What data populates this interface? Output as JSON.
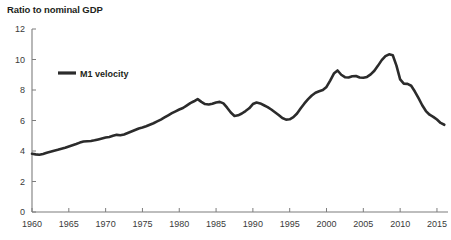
{
  "chart_data": {
    "type": "line",
    "title": "Ratio to nominal GDP",
    "xlabel": "",
    "ylabel": "Ratio to nominal GDP",
    "xlim": [
      1960,
      2016.5
    ],
    "ylim": [
      0,
      12
    ],
    "yticks": [
      0,
      2,
      4,
      6,
      8,
      10,
      12
    ],
    "ytick_labels": [
      "0",
      "2",
      "4",
      "6",
      "8",
      "10",
      "12"
    ],
    "xticks": [
      1960,
      1965,
      1970,
      1975,
      1980,
      1985,
      1990,
      1995,
      2000,
      2005,
      2010,
      2015
    ],
    "xtick_labels": [
      "1960",
      "1965",
      "1970",
      "1975",
      "1980",
      "1985",
      "1990",
      "1995",
      "2000",
      "2005",
      "2010",
      "2015"
    ],
    "grid": false,
    "legend_position": "upper-left-inside",
    "line_color": "#2b2b2b",
    "axis_color": "#7d7d7d",
    "background_color": "#ffffff",
    "series": [
      {
        "name": "M1 velocity",
        "x": [
          1960.0,
          1960.5,
          1961.0,
          1961.5,
          1962.0,
          1962.5,
          1963.0,
          1963.5,
          1964.0,
          1964.5,
          1965.0,
          1965.5,
          1966.0,
          1966.5,
          1967.0,
          1967.5,
          1968.0,
          1968.5,
          1969.0,
          1969.5,
          1970.0,
          1970.5,
          1971.0,
          1971.5,
          1972.0,
          1972.5,
          1973.0,
          1973.5,
          1974.0,
          1974.5,
          1975.0,
          1975.5,
          1976.0,
          1976.5,
          1977.0,
          1977.5,
          1978.0,
          1978.5,
          1979.0,
          1979.5,
          1980.0,
          1980.5,
          1981.0,
          1981.5,
          1982.0,
          1982.5,
          1983.0,
          1983.5,
          1984.0,
          1984.5,
          1985.0,
          1985.5,
          1986.0,
          1986.5,
          1987.0,
          1987.5,
          1988.0,
          1988.5,
          1989.0,
          1989.5,
          1990.0,
          1990.5,
          1991.0,
          1991.5,
          1992.0,
          1992.5,
          1993.0,
          1993.5,
          1994.0,
          1994.5,
          1995.0,
          1995.5,
          1996.0,
          1996.5,
          1997.0,
          1997.5,
          1998.0,
          1998.5,
          1999.0,
          1999.5,
          2000.0,
          2000.5,
          2001.0,
          2001.5,
          2002.0,
          2002.5,
          2003.0,
          2003.5,
          2004.0,
          2004.5,
          2005.0,
          2005.5,
          2006.0,
          2006.5,
          2007.0,
          2007.5,
          2008.0,
          2008.5,
          2009.0,
          2009.5,
          2010.0,
          2010.5,
          2011.0,
          2011.5,
          2012.0,
          2012.5,
          2013.0,
          2013.5,
          2014.0,
          2014.5,
          2015.0,
          2015.5,
          2016.0
        ],
        "values": [
          3.82,
          3.78,
          3.75,
          3.8,
          3.88,
          3.95,
          4.02,
          4.08,
          4.15,
          4.22,
          4.3,
          4.38,
          4.46,
          4.55,
          4.62,
          4.64,
          4.66,
          4.7,
          4.76,
          4.82,
          4.88,
          4.92,
          5.0,
          5.06,
          5.03,
          5.08,
          5.18,
          5.28,
          5.38,
          5.48,
          5.54,
          5.62,
          5.72,
          5.82,
          5.94,
          6.06,
          6.2,
          6.34,
          6.48,
          6.6,
          6.72,
          6.82,
          6.98,
          7.14,
          7.26,
          7.4,
          7.22,
          7.08,
          7.05,
          7.1,
          7.18,
          7.22,
          7.12,
          6.84,
          6.52,
          6.3,
          6.34,
          6.46,
          6.62,
          6.8,
          7.08,
          7.18,
          7.12,
          7.0,
          6.88,
          6.72,
          6.54,
          6.36,
          6.16,
          6.06,
          6.08,
          6.22,
          6.46,
          6.8,
          7.12,
          7.4,
          7.64,
          7.82,
          7.92,
          8.0,
          8.2,
          8.62,
          9.08,
          9.28,
          9.0,
          8.84,
          8.82,
          8.9,
          8.92,
          8.82,
          8.8,
          8.86,
          9.02,
          9.26,
          9.6,
          9.96,
          10.22,
          10.34,
          10.28,
          9.6,
          8.7,
          8.42,
          8.4,
          8.28,
          7.9,
          7.46,
          7.0,
          6.62,
          6.38,
          6.24,
          6.06,
          5.84,
          5.72
        ]
      }
    ],
    "annotations": []
  },
  "legend": {
    "entries": [
      {
        "label": "M1 velocity",
        "color": "#2b2b2b"
      }
    ]
  }
}
